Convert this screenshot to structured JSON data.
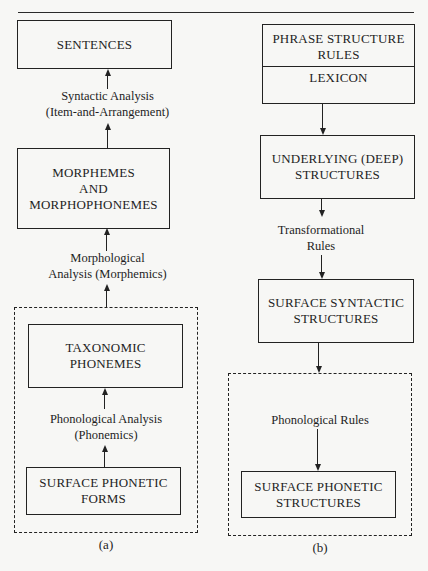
{
  "diagram": {
    "panel_a": {
      "caption": "(a)",
      "nodes": {
        "sentences": "SENTENCES",
        "morphemes_line1": "MORPHEMES",
        "morphemes_line2": "AND",
        "morphemes_line3": "MORPHOPHONEMES",
        "taxonomic_line1": "TAXONOMIC",
        "taxonomic_line2": "PHONEMES",
        "surface_forms_line1": "SURFACE PHONETIC",
        "surface_forms_line2": "FORMS"
      },
      "edges": {
        "syntactic_line1": "Syntactic Analysis",
        "syntactic_line2": "(Item-and-Arrangement)",
        "morphological_line1": "Morphological",
        "morphological_line2": "Analysis (Morphemics)",
        "phonological_line1": "Phonological Analysis",
        "phonological_line2": "(Phonemics)"
      },
      "direction": "bottom-to-top"
    },
    "panel_b": {
      "caption": "(b)",
      "nodes": {
        "psr_line1": "PHRASE STRUCTURE",
        "psr_line2": "RULES",
        "lexicon": "LEXICON",
        "deep_line1": "UNDERLYING (DEEP)",
        "deep_line2": "STRUCTURES",
        "surface_syntactic_line1": "SURFACE SYNTACTIC",
        "surface_syntactic_line2": "STRUCTURES",
        "surface_phonetic_line1": "SURFACE PHONETIC",
        "surface_phonetic_line2": "STRUCTURES"
      },
      "edges": {
        "transformational_line1": "Transformational",
        "transformational_line2": "Rules",
        "phonological_rules": "Phonological Rules"
      },
      "direction": "top-to-bottom"
    }
  }
}
